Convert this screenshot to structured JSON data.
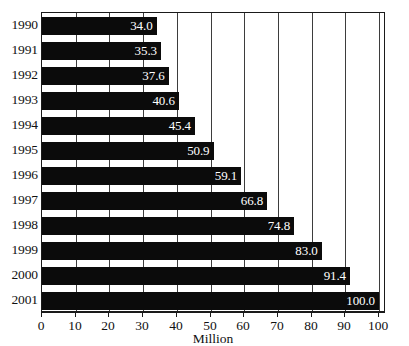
{
  "chart_data": {
    "type": "bar",
    "orientation": "horizontal",
    "title": "",
    "subtitle": "",
    "xlabel": "Million",
    "ylabel": "",
    "categories": [
      "1990",
      "1991",
      "1992",
      "1993",
      "1994",
      "1995",
      "1996",
      "1997",
      "1998",
      "1999",
      "2000",
      "2001"
    ],
    "values": [
      34.0,
      45.4,
      37.6,
      40.6,
      45.4,
      50.9,
      59.1,
      66.8,
      74.8,
      83.0,
      91.4,
      100.0
    ],
    "bars": [
      {
        "category": "1990",
        "value": 34.0,
        "label": "34.0"
      },
      {
        "category": "1991",
        "value": 35.3,
        "label": "35.3"
      },
      {
        "category": "1992",
        "value": 37.6,
        "label": "37.6"
      },
      {
        "category": "1993",
        "value": 40.6,
        "label": "40.6"
      },
      {
        "category": "1994",
        "value": 45.4,
        "label": "45.4"
      },
      {
        "category": "1995",
        "value": 50.9,
        "label": "50.9"
      },
      {
        "category": "1996",
        "value": 59.1,
        "label": "59.1"
      },
      {
        "category": "1997",
        "value": 66.8,
        "label": "66.8"
      },
      {
        "category": "1998",
        "value": 74.8,
        "label": "74.8"
      },
      {
        "category": "1999",
        "value": 83.0,
        "label": "83.0"
      },
      {
        "category": "2000",
        "value": 91.4,
        "label": "91.4"
      },
      {
        "category": "2001",
        "value": 100.0,
        "label": "100.0"
      }
    ],
    "xlim": [
      0,
      100
    ],
    "xticks": [
      0,
      10,
      20,
      30,
      40,
      50,
      60,
      70,
      80,
      90,
      100
    ],
    "xticklabels": [
      "0",
      "10",
      "20",
      "30",
      "40",
      "50",
      "60",
      "70",
      "80",
      "90",
      "100"
    ],
    "grid": {
      "vertical": true,
      "horizontal": false
    },
    "legend": {
      "visible": false,
      "position": "none"
    },
    "colors": {
      "bar": "#0b0b0b",
      "bar_value_text": "#ffffff",
      "gridline": "#3d3d3d",
      "axis": "#1a1a1a",
      "background": "#ffffff",
      "text": "#111111"
    }
  }
}
